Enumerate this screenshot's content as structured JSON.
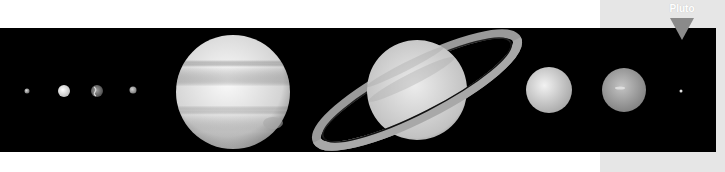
{
  "image": {
    "description": "Solar system planets lined up in scale against black space",
    "background_color": "#000000",
    "panel_color": "#e6e6e6"
  },
  "label": {
    "text": "Pluto",
    "marker_color": "#8a8a8a"
  },
  "planets": [
    {
      "name": "Mercury",
      "cx": 27,
      "cy": 63,
      "r": 2.5
    },
    {
      "name": "Venus",
      "cx": 64,
      "cy": 63,
      "r": 6
    },
    {
      "name": "Earth",
      "cx": 97,
      "cy": 63,
      "r": 6
    },
    {
      "name": "Mars",
      "cx": 133,
      "cy": 62,
      "r": 3.5
    },
    {
      "name": "Jupiter",
      "cx": 233,
      "cy": 64,
      "r": 57
    },
    {
      "name": "Saturn",
      "cx": 417,
      "cy": 62,
      "r": 50
    },
    {
      "name": "Uranus",
      "cx": 549,
      "cy": 62,
      "r": 23
    },
    {
      "name": "Neptune",
      "cx": 624,
      "cy": 62,
      "r": 22
    },
    {
      "name": "Pluto",
      "cx": 681,
      "cy": 63,
      "r": 1.5
    }
  ]
}
